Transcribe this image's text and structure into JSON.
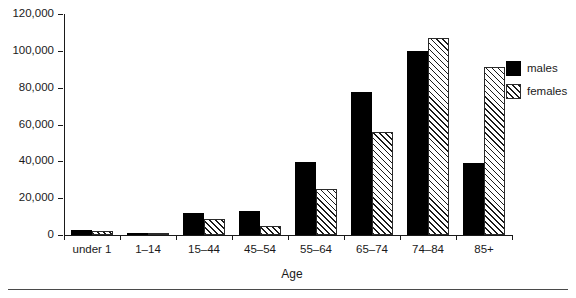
{
  "chart_data": {
    "type": "bar",
    "title": "",
    "subtitle": "",
    "xlabel": "Age",
    "ylabel": "",
    "categories": [
      "under 1",
      "1–14",
      "15–44",
      "45–54",
      "55–64",
      "65–74",
      "74–84",
      "85+"
    ],
    "series": [
      {
        "name": "males",
        "color": "#000000",
        "values": [
          2800,
          1200,
          12000,
          13000,
          39500,
          77500,
          100000,
          39000
        ]
      },
      {
        "name": "females",
        "color": "#ffffff",
        "values": [
          2200,
          900,
          8500,
          5000,
          25000,
          56000,
          107000,
          91000
        ]
      }
    ],
    "ylim": [
      0,
      120000
    ],
    "ytick_values": [
      0,
      20000,
      40000,
      60000,
      80000,
      100000,
      120000
    ],
    "ytick_labels": [
      "0",
      "20,000",
      "40,000",
      "60,000",
      "80,000",
      "100,000",
      "120,000"
    ],
    "grid": false,
    "legend_position": "right",
    "legend": [
      "males",
      "females"
    ]
  },
  "axis": {
    "x_title": "Age"
  },
  "legend": {
    "items": [
      {
        "label": "males"
      },
      {
        "label": "females"
      }
    ]
  }
}
